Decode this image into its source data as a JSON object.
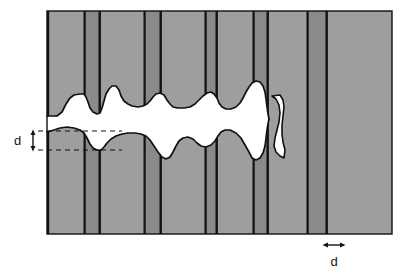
{
  "figure": {
    "background_color": "#ffffff"
  },
  "colors": {
    "matrix_light": "#9e9e9e",
    "lamella_dark": "#8a8a8a",
    "boundary_line": "#111111",
    "fracture_gap": "#ffffff",
    "label_color": "#141414",
    "dashed_line": "#111111"
  },
  "block": {
    "left": 47,
    "right": 392,
    "top": 11,
    "bottom": 234,
    "outline_color": "#111111"
  },
  "labels": {
    "spacing_label": "d",
    "width_label": "d"
  },
  "annotations": {
    "vertical_measure": {
      "name": "interlamellar-spacing",
      "label": "d",
      "label_x": 14,
      "label_y": 144,
      "arrow_x": 33,
      "arrow_top": 131,
      "arrow_bottom": 150,
      "dash_line_upper_y": 131,
      "dash_line_upper_x1": 38,
      "dash_line_upper_x2": 122,
      "dash_line_lower_y": 150,
      "dash_line_lower_x1": 38,
      "dash_line_lower_x2": 122
    },
    "horizontal_measure": {
      "name": "lamella-width",
      "label": "d",
      "label_x": 332,
      "label_y": 266,
      "arrow_y": 245,
      "arrow_left": 324,
      "arrow_right": 344
    }
  },
  "bands": [
    {
      "x": 47,
      "w": 38,
      "shade": "matrix_light"
    },
    {
      "x": 85,
      "w": 14,
      "shade": "lamella_dark"
    },
    {
      "x": 99,
      "w": 2,
      "shade": "boundary_line"
    },
    {
      "x": 101,
      "w": 44,
      "shade": "matrix_light"
    },
    {
      "x": 145,
      "w": 15,
      "shade": "lamella_dark"
    },
    {
      "x": 160,
      "w": 2,
      "shade": "boundary_line"
    },
    {
      "x": 162,
      "w": 44,
      "shade": "matrix_light"
    },
    {
      "x": 206,
      "w": 10,
      "shade": "lamella_dark"
    },
    {
      "x": 216,
      "w": 2,
      "shade": "boundary_line"
    },
    {
      "x": 218,
      "w": 36,
      "shade": "matrix_light"
    },
    {
      "x": 254,
      "w": 13,
      "shade": "lamella_dark"
    },
    {
      "x": 267,
      "w": 2,
      "shade": "boundary_line"
    },
    {
      "x": 269,
      "w": 39,
      "shade": "matrix_light"
    },
    {
      "x": 308,
      "w": 18,
      "shade": "lamella_dark"
    },
    {
      "x": 326,
      "w": 2,
      "shade": "boundary_line"
    },
    {
      "x": 328,
      "w": 64,
      "shade": "matrix_light"
    }
  ],
  "boundary_lines_x": [
    47,
    85,
    99,
    145,
    160,
    206,
    216,
    254,
    267,
    308,
    326,
    392
  ],
  "fracture": {
    "upper_profile": "M47,116 L57,116 L62,112 L66,104 L70,98 L74,95 L80,94 L84,94 L86,97 L88,102 L90,108 L93,112 L97,114 L100,113 L102,108 L104,101 L106,94 L109,89 L112,86 L116,86 L119,90 L121,96 L124,101 L128,104 L132,106 L138,107 L143,106 L147,104 L150,101 L153,97 L156,94 L160,93 L164,95 L167,100 L170,104 L173,107 L178,108 L184,108 L190,107 L195,104 L199,100 L203,96 L207,93 L211,92 L214,94 L217,98 L219,103 L222,107 L226,109 L231,109 L236,107 L240,103 L243,98 L246,92 L249,87 L252,83 L256,81 L260,82 L263,86 L265,92 L266,99 L267,107 L268,114 L269,119",
    "lower_profile": "M47,132 L54,130 L60,128 L67,127 L74,128 L80,130 L84,133 L87,138 L90,144 L93,148 L97,150 L101,150 L104,147 L107,143 L111,139 L116,136 L122,134 L128,133 L135,133 L141,134 L146,136 L150,140 L154,146 L158,152 L162,157 L166,159 L170,157 L173,152 L176,146 L179,141 L183,138 L188,137 L193,139 L197,143 L201,146 L206,147 L211,145 L215,141 L218,136 L221,132 L225,130 L230,130 L236,133 L241,138 L245,145 L249,152 L252,158 L256,160 L260,158 L263,153 L265,146 L266,138 L267,130 L268,124 L269,119",
    "gap_right_x": 269,
    "gap_notes": "Narrow vertical white sliver continues from the main gap up and down near x=272-285 between y=96 and y=158."
  },
  "gap_sliver": {
    "path": "M272,96 L276,99 L279,105 L280,113 L279,122 L277,130 L275,138 L274,146 L276,152 L280,156 L284,158 L284,152 L282,144 L281,135 L281,126 L282,117 L283,108 L282,101 L279,96 Z"
  }
}
